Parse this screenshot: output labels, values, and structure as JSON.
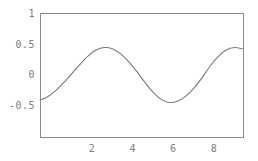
{
  "chart_data": {
    "type": "line",
    "title": "",
    "subtitle": "",
    "xlabel": "",
    "ylabel": "",
    "xlim": [
      -0.55,
      9.4
    ],
    "ylim": [
      -0.78,
      1.0
    ],
    "grid": false,
    "legend": null,
    "x_ticks": [
      2,
      4,
      6,
      8
    ],
    "x_tick_labels": [
      "2",
      "4",
      "6",
      "8"
    ],
    "y_ticks": [
      -0.5,
      0,
      0.5,
      1
    ],
    "y_tick_labels": [
      "-0.5",
      "0",
      "0.5",
      "1"
    ],
    "line_color": "#7a7a7a",
    "frame_color": "#8a8a8a",
    "background_color": "#ffffff",
    "series": [
      {
        "name": "curve",
        "x": [
          -0.55,
          -0.2,
          0.2,
          0.6,
          1.0,
          1.4,
          1.8,
          2.2,
          2.6,
          3.0,
          3.4,
          3.8,
          4.2,
          4.6,
          5.0,
          5.4,
          5.8,
          6.2,
          6.6,
          7.0,
          7.4,
          7.8,
          8.2,
          8.6,
          9.0,
          9.4
        ],
        "y": [
          -0.41,
          -0.36,
          -0.26,
          -0.13,
          0.02,
          0.17,
          0.31,
          0.41,
          0.45,
          0.43,
          0.35,
          0.22,
          0.06,
          -0.12,
          -0.28,
          -0.4,
          -0.45,
          -0.43,
          -0.35,
          -0.22,
          -0.05,
          0.14,
          0.3,
          0.41,
          0.45,
          0.43
        ]
      }
    ],
    "annotations": []
  },
  "axis": {
    "y_labels": [
      "1",
      "0.5",
      "0",
      "-0.5"
    ],
    "x_labels": [
      "2",
      "4",
      "6",
      "8"
    ]
  }
}
